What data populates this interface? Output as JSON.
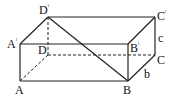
{
  "figure": {
    "type": "rectangular-prism",
    "vertices": {
      "A": {
        "label": "A",
        "prime": false,
        "x": 20,
        "y": 81
      },
      "B": {
        "label": "B",
        "prime": false,
        "x": 128,
        "y": 81
      },
      "C": {
        "label": "C",
        "prime": false,
        "x": 155,
        "y": 55
      },
      "D": {
        "label": "D",
        "prime": false,
        "x": 48,
        "y": 55
      },
      "A1": {
        "label": "A",
        "prime": true,
        "x": 20,
        "y": 44
      },
      "B1": {
        "label": "B",
        "prime": true,
        "x": 128,
        "y": 44
      },
      "C1": {
        "label": "C",
        "prime": true,
        "x": 155,
        "y": 17
      },
      "D1": {
        "label": "D",
        "prime": true,
        "x": 48,
        "y": 17
      }
    },
    "prime_mark": "ˡ",
    "edge_labels": {
      "c": {
        "text": "c",
        "edge": "C'C"
      },
      "b": {
        "text": "b",
        "edge": "BC"
      }
    },
    "solid_edges": [
      "A'D'",
      "D'C'",
      "C'B'",
      "A'B'",
      "A'A",
      "AB",
      "BB'",
      "BC",
      "CC'",
      "D'B"
    ],
    "dashed_edges": [
      "D'D",
      "DA",
      "DC"
    ]
  }
}
